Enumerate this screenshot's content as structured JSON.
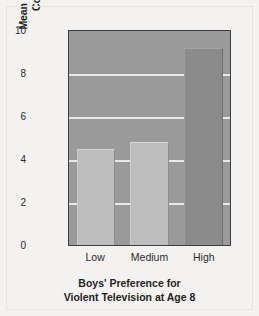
{
  "chart_data": {
    "type": "bar",
    "title": "",
    "categories": [
      "Low",
      "Medium",
      "High"
    ],
    "values": [
      4.5,
      4.8,
      9.2
    ],
    "series": [
      {
        "name": "Mean Seriousness of Criminal Convictions by Age 30",
        "values": [
          4.5,
          4.8,
          9.2
        ]
      }
    ],
    "xlabel": "Boys' Preference for Violent Television at Age 8",
    "ylabel": "Mean Seriousness of Criminal Convictions by Age 30",
    "ylim": [
      0,
      10
    ],
    "yticks": [
      0,
      2,
      4,
      6,
      8,
      10
    ],
    "ytick_labels": [
      "0",
      "2",
      "4",
      "6",
      "8",
      "10"
    ],
    "grid": "horizontal",
    "legend": "none",
    "bar_colors": [
      "#bdbdbd",
      "#bdbdbd",
      "#8b8b8b"
    ],
    "plot_background": "#9a9a9a",
    "gridline_color": "#e9e9e9",
    "figure_background": "#f3f2f0"
  },
  "axes": {
    "y_title_line1": "Mean Seriousness of Criminal",
    "y_title_line2": "Convictions by Age 30",
    "x_title_line1": "Boys' Preference for",
    "x_title_line2": "Violent Television at Age 8"
  }
}
